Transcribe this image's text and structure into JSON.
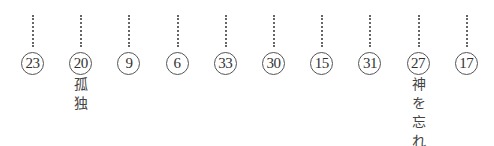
{
  "items": [
    {
      "number": "23",
      "label": ""
    },
    {
      "number": "20",
      "label": "孤\n独"
    },
    {
      "number": "9",
      "label": ""
    },
    {
      "number": "6",
      "label": ""
    },
    {
      "number": "33",
      "label": ""
    },
    {
      "number": "30",
      "label": ""
    },
    {
      "number": "15",
      "label": ""
    },
    {
      "number": "31",
      "label": ""
    },
    {
      "number": "27",
      "label": "神\nを\n忘\nれ"
    },
    {
      "number": "17",
      "label": ""
    }
  ]
}
